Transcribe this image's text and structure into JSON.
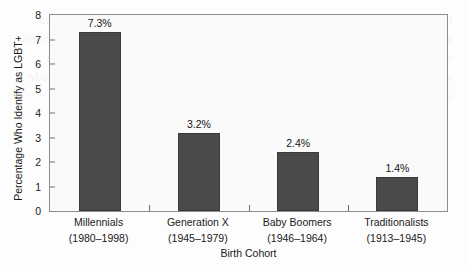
{
  "chart_data": {
    "type": "bar",
    "title": "",
    "subtitle": "",
    "xlabel": "Birth Cohort",
    "ylabel": "Percentage Who Identify as LGBT+",
    "categories": [
      "Millennials",
      "Generation X",
      "Baby Boomers",
      "Traditionalists"
    ],
    "category_years": [
      "(1980–1998)",
      "(1945–1979)",
      "(1946–1964)",
      "(1913–1945)"
    ],
    "values": [
      7.3,
      3.2,
      2.4,
      1.4
    ],
    "data_labels": [
      "7.3%",
      "3.2%",
      "2.4%",
      "1.4%"
    ],
    "ylim": [
      0,
      8
    ],
    "yticks": [
      0,
      1,
      2,
      3,
      4,
      5,
      6,
      7,
      8
    ],
    "ytick_labels": [
      "0",
      "1",
      "2",
      "3",
      "4",
      "5",
      "6",
      "7",
      "8"
    ],
    "grid": false,
    "legend": false,
    "legend_position": "none",
    "series": [
      {
        "name": "Percentage Who Identify as LGBT+",
        "values": [
          7.3,
          3.2,
          2.4,
          1.4
        ],
        "color": "#4a4a4a"
      }
    ],
    "colors": {
      "bar": "#4a4a4a",
      "bar_edge": "#3a3a3a",
      "axis": "#8d8d8d",
      "tick": "#6d6d6d",
      "text": "#1a1a1a",
      "plot_background": "#fafafa",
      "figure_background": "#fdfdfd"
    }
  },
  "background_bleed": "the percentage of adults in the younger generation who identify as lesbian gay bisexual or transgender has risen steadily across successive birth cohorts while the oldest traditionalists report the lowest rates of identification in survey data collected by national polling organizations over the past decade of continuous measurement"
}
